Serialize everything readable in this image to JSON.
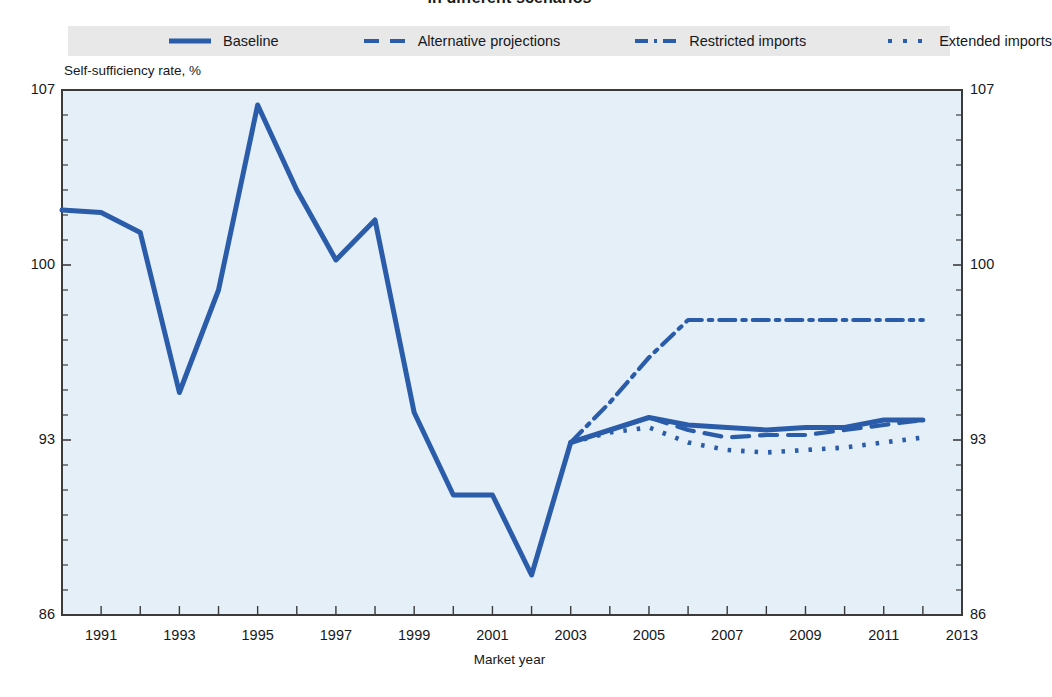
{
  "chart_data": {
    "type": "line",
    "title": "in different scenarios",
    "xlabel": "Market year",
    "ylabel": "Self-sufficiency rate, %",
    "xlim": [
      1990,
      2013
    ],
    "ylim": [
      86,
      107
    ],
    "yticks": [
      86,
      93,
      100,
      107
    ],
    "ytick_labels": [
      "86",
      "93",
      "100",
      "107"
    ],
    "y_minor_step": 1,
    "xticks": [
      1991,
      1993,
      1995,
      1997,
      1999,
      2001,
      2003,
      2005,
      2007,
      2009,
      2011,
      2013
    ],
    "xtick_labels": [
      "1991",
      "1993",
      "1995",
      "1997",
      "1999",
      "2001",
      "2003",
      "2005",
      "2007",
      "2009",
      "2011",
      "2013"
    ],
    "x_minor_step": 1,
    "grid": false,
    "legend_position": "top",
    "plot_bgcolor": "#e4eff7",
    "series_color": "#2a5caa",
    "series": [
      {
        "name": "Baseline",
        "dash": "solid",
        "x": [
          1990,
          1991,
          1992,
          1993,
          1994,
          1995,
          1996,
          1997,
          1998,
          1999,
          2000,
          2001,
          2002,
          2003,
          2004,
          2005,
          2006,
          2007,
          2008,
          2009,
          2010,
          2011,
          2012
        ],
        "values": [
          102.2,
          102.1,
          101.3,
          94.9,
          99.0,
          106.4,
          103.0,
          100.2,
          101.8,
          94.1,
          90.8,
          90.8,
          87.6,
          92.9,
          93.4,
          93.9,
          93.6,
          93.5,
          93.4,
          93.5,
          93.5,
          93.8,
          93.8
        ]
      },
      {
        "name": "Alternative projections",
        "dash": "dashed",
        "x": [
          2003,
          2004,
          2005,
          2006,
          2007,
          2008,
          2009,
          2010,
          2011,
          2012
        ],
        "values": [
          92.9,
          93.4,
          93.9,
          93.4,
          93.1,
          93.2,
          93.2,
          93.4,
          93.6,
          93.8
        ]
      },
      {
        "name": "Restricted imports",
        "dash": "dashdot",
        "x": [
          2003,
          2004,
          2005,
          2006,
          2007,
          2008,
          2009,
          2010,
          2011,
          2012
        ],
        "values": [
          92.9,
          94.5,
          96.3,
          97.8,
          97.8,
          97.8,
          97.8,
          97.8,
          97.8,
          97.8
        ]
      },
      {
        "name": "Extended imports",
        "dash": "dotted",
        "x": [
          2003,
          2004,
          2005,
          2006,
          2007,
          2008,
          2009,
          2010,
          2011,
          2012
        ],
        "values": [
          92.9,
          93.3,
          93.5,
          92.9,
          92.6,
          92.5,
          92.6,
          92.7,
          92.9,
          93.1
        ]
      }
    ]
  },
  "legend": {
    "items": [
      {
        "label": "Baseline",
        "dash": "solid"
      },
      {
        "label": "Alternative projections",
        "dash": "dashed"
      },
      {
        "label": "Restricted imports",
        "dash": "dashdot"
      },
      {
        "label": "Extended imports",
        "dash": "dotted"
      }
    ]
  }
}
